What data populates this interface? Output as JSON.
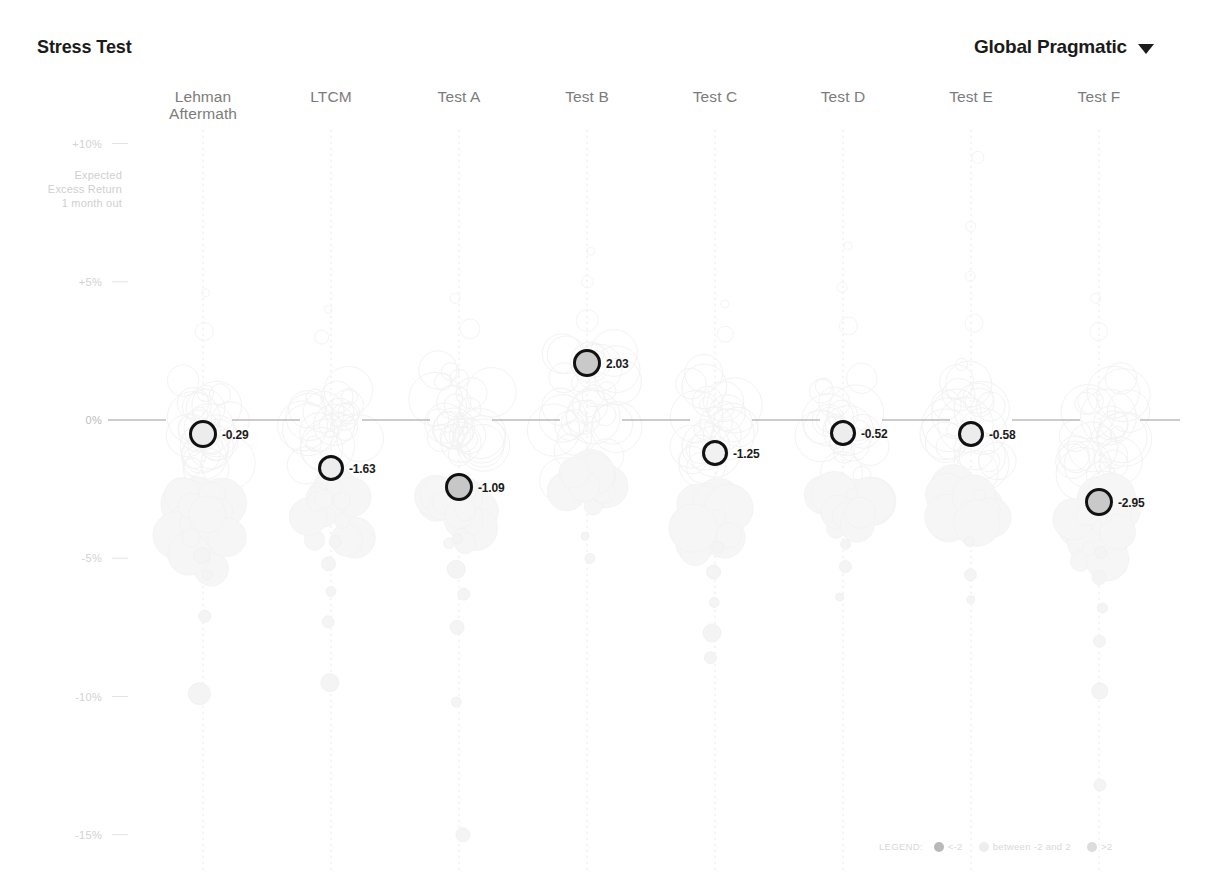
{
  "header": {
    "title": "Stress Test",
    "selector_label": "Global Pragmatic",
    "caret_icon": "chevron-down-icon"
  },
  "axis": {
    "note": "Expected\nExcess Return\n1 month out",
    "ticks": [
      {
        "label": "+10%",
        "value": 10
      },
      {
        "label": "+5%",
        "value": 5
      },
      {
        "label": "0%",
        "value": 0
      },
      {
        "label": "-5%",
        "value": -5
      },
      {
        "label": "-10%",
        "value": -10
      },
      {
        "label": "-15%",
        "value": -15
      }
    ]
  },
  "legend": {
    "title": "LEGEND:",
    "items": [
      {
        "label": "<-2",
        "color": "#b9b9b9"
      },
      {
        "label": "between -2 and 2",
        "color": "#eeeeee"
      },
      {
        "label": ">2",
        "color": "#dcdcdc"
      }
    ]
  },
  "chart_data": {
    "type": "scatter",
    "title": "Stress Test",
    "subtitle": "Global Pragmatic",
    "xlabel": "",
    "ylabel": "Expected Excess Return 1 month out",
    "ylim": [
      -17,
      11.5
    ],
    "ytick_values": [
      10,
      5,
      0,
      -5,
      -10,
      -15
    ],
    "ytick_labels": [
      "+10%",
      "+5%",
      "0%",
      "-5%",
      "-10%",
      "-15%"
    ],
    "grid": false,
    "legend_position": "bottom-right",
    "categories": [
      "Lehman\nAftermath",
      "LTCM",
      "Test A",
      "Test B",
      "Test C",
      "Test D",
      "Test E",
      "Test F"
    ],
    "series": [
      {
        "name": "Portfolio stress outcome",
        "points": [
          {
            "category": "Lehman\nAftermath",
            "label": "-0.29",
            "value": -0.29,
            "y_pct": -0.5,
            "fill": "#ececec",
            "radius": 14
          },
          {
            "category": "LTCM",
            "label": "-1.63",
            "value": -1.63,
            "y_pct": -1.73,
            "fill": "#ededed",
            "radius": 13
          },
          {
            "category": "Test A",
            "label": "-1.09",
            "value": -1.09,
            "y_pct": -2.43,
            "fill": "#c7c7c7",
            "radius": 14
          },
          {
            "category": "Test B",
            "label": "2.03",
            "value": 2.03,
            "y_pct": 2.06,
            "fill": "#c9c9c9",
            "radius": 14
          },
          {
            "category": "Test C",
            "label": "-1.25",
            "value": -1.25,
            "y_pct": -1.19,
            "fill": "#f1f1f1",
            "radius": 13
          },
          {
            "category": "Test D",
            "label": "-0.52",
            "value": -0.52,
            "y_pct": -0.47,
            "fill": "#ededed",
            "radius": 13
          },
          {
            "category": "Test E",
            "label": "-0.58",
            "value": -0.58,
            "y_pct": -0.51,
            "fill": "#ececec",
            "radius": 13
          },
          {
            "category": "Test F",
            "label": "-2.95",
            "value": -2.95,
            "y_pct": -2.97,
            "fill": "#c9c9c9",
            "radius": 14
          }
        ]
      }
    ],
    "background_swarm_note": "Faint beeswarm distribution of simulated outcomes per scenario column, drawn as pale outlined and pale filled bubbles along a dotted vertical spine."
  }
}
